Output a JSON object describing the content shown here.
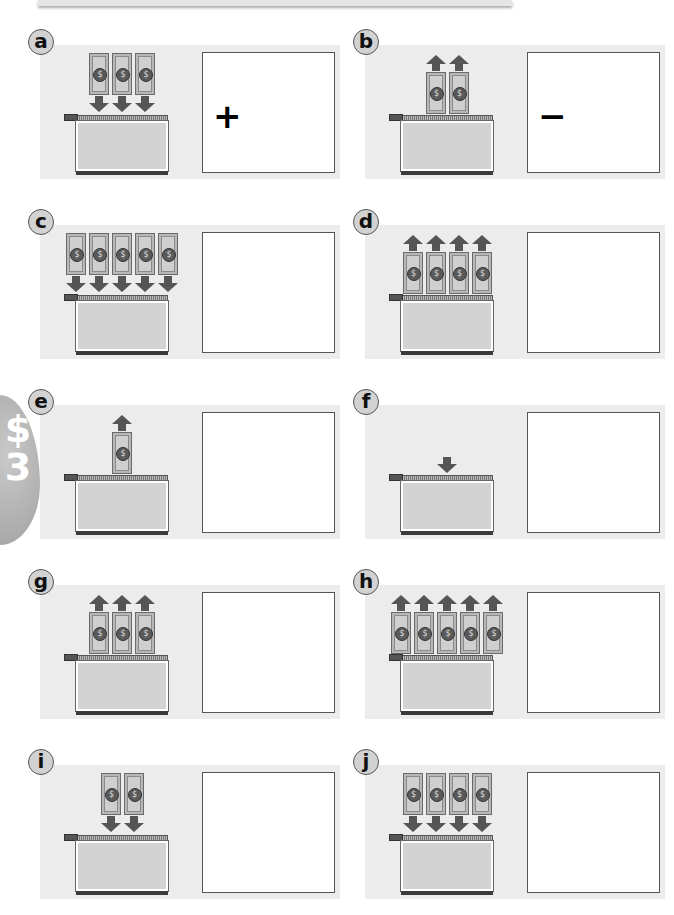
{
  "side_tab": {
    "symbol": "$",
    "number": "3"
  },
  "colors": {
    "panel_bg": "#ececec",
    "badge_bg": "#d2d2d2",
    "arrow": "#555555",
    "bill": "#b7b7b7",
    "wallet": "#d3d3d3"
  },
  "bill_seal_glyph": "$",
  "problems": [
    {
      "letter": "a",
      "direction": "in",
      "bills": 3,
      "answer_sign": "+"
    },
    {
      "letter": "b",
      "direction": "out",
      "bills": 2,
      "answer_sign": "−"
    },
    {
      "letter": "c",
      "direction": "in",
      "bills": 5,
      "answer_sign": ""
    },
    {
      "letter": "d",
      "direction": "out",
      "bills": 4,
      "answer_sign": ""
    },
    {
      "letter": "e",
      "direction": "out",
      "bills": 1,
      "answer_sign": ""
    },
    {
      "letter": "f",
      "direction": "in",
      "bills": 0,
      "answer_sign": ""
    },
    {
      "letter": "g",
      "direction": "out",
      "bills": 3,
      "answer_sign": ""
    },
    {
      "letter": "h",
      "direction": "out",
      "bills": 5,
      "answer_sign": ""
    },
    {
      "letter": "i",
      "direction": "in",
      "bills": 2,
      "answer_sign": ""
    },
    {
      "letter": "j",
      "direction": "in",
      "bills": 4,
      "answer_sign": ""
    }
  ]
}
